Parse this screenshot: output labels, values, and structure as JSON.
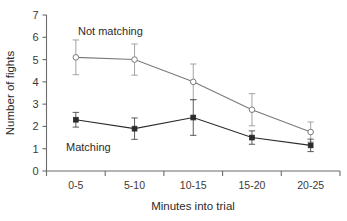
{
  "chart_data": {
    "type": "line",
    "title": "",
    "xlabel": "Minutes into trial",
    "ylabel": "Number of fights",
    "categories": [
      "0-5",
      "5-10",
      "10-15",
      "15-20",
      "20-25"
    ],
    "ylim": [
      0,
      7
    ],
    "yticks": [
      0,
      1,
      2,
      3,
      4,
      5,
      6,
      7
    ],
    "ytick_labels": [
      "0",
      "1",
      "2",
      "3",
      "4",
      "5",
      "6",
      "7"
    ],
    "grid": false,
    "legend_position": "inline-annotations",
    "error_bars": "symmetric",
    "series": [
      {
        "name": "Not matching",
        "marker": "open-circle",
        "color": "#7a7a7a",
        "values": [
          5.1,
          5.0,
          4.0,
          2.75,
          1.75
        ],
        "errors": [
          0.78,
          0.7,
          0.8,
          0.72,
          0.45
        ],
        "label_text": "Not matching"
      },
      {
        "name": "Matching",
        "marker": "filled-square",
        "color": "#2b2b2b",
        "values": [
          2.3,
          1.9,
          2.4,
          1.5,
          1.15
        ],
        "errors": [
          0.33,
          0.48,
          0.8,
          0.3,
          0.28
        ],
        "label_text": "Matching"
      }
    ],
    "annotations": [
      {
        "text": "Not matching",
        "series": "Not matching"
      },
      {
        "text": "Matching",
        "series": "Matching"
      }
    ]
  },
  "axis": {
    "y_title": "Number of fights",
    "x_title": "Minutes into trial"
  },
  "colors": {
    "not_matching": "#7a7a7a",
    "matching": "#2b2b2b",
    "axis": "#6b6b6b",
    "text": "#2b2b2b",
    "background": "#ffffff"
  }
}
